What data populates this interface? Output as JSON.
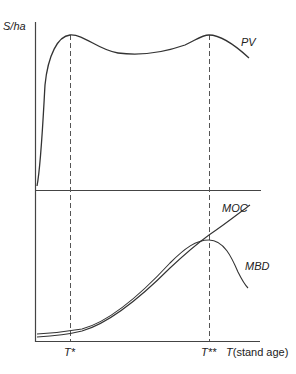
{
  "diagram": {
    "y_axis_label": "S/ha",
    "x_axis_label_italic": "T",
    "x_axis_label_rest": "(stand age)",
    "curves": {
      "pv": "PV",
      "moc": "MOC",
      "mbd": "MBD"
    },
    "markers": {
      "t_star": "T*",
      "t_double_star": "T**"
    },
    "colors": {
      "line": "#333333",
      "dashed": "#555555",
      "background": "#ffffff"
    }
  }
}
